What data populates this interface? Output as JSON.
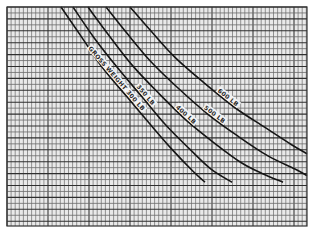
{
  "chart_data": {
    "type": "line",
    "title": "",
    "xlabel": "",
    "ylabel": "",
    "xlim": [
      0,
      100
    ],
    "ylim": [
      0,
      100
    ],
    "grid": true,
    "legend": "none",
    "series": [
      {
        "name": "GROSS WEIGHT 300 LB",
        "x": [
          18,
          25,
          32,
          40,
          48,
          55,
          62,
          66
        ],
        "y": [
          100,
          86,
          72,
          59,
          46,
          35,
          25,
          20
        ]
      },
      {
        "name": "350 LB",
        "x": [
          22,
          29,
          37,
          45,
          53,
          61,
          68,
          75
        ],
        "y": [
          100,
          86,
          72,
          59,
          46,
          35,
          26,
          20
        ]
      },
      {
        "name": "400 LB",
        "x": [
          27,
          34,
          42,
          51,
          60,
          69,
          78,
          85,
          92
        ],
        "y": [
          100,
          87,
          73,
          60,
          48,
          38,
          29,
          24,
          20
        ]
      },
      {
        "name": "500 LB",
        "x": [
          33,
          40,
          48,
          57,
          67,
          77,
          87,
          96,
          100
        ],
        "y": [
          100,
          88,
          75,
          63,
          51,
          41,
          32,
          26,
          23
        ]
      },
      {
        "name": "600 LB",
        "x": [
          41,
          48,
          56,
          66,
          76,
          86,
          95,
          100
        ],
        "y": [
          100,
          89,
          77,
          65,
          54,
          45,
          37,
          33
        ]
      }
    ],
    "annotations": [
      "GROSS WEIGHT 300 LB",
      "350 LB",
      "400 LB",
      "500 LB",
      "600 LB"
    ]
  }
}
